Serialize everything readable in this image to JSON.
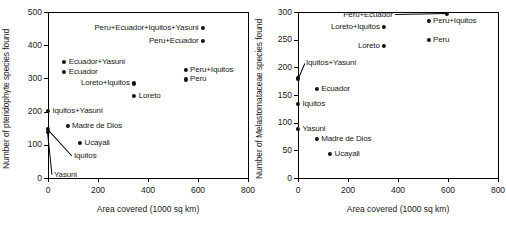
{
  "figure": {
    "panels": [
      {
        "id": "pteridophyte",
        "xlabel": "Area covered (1000 sq km)",
        "ylabel": "Number of pteridophyte species found",
        "xticks": [
          "0",
          "200",
          "400",
          "600",
          "800"
        ],
        "yticks": [
          "0",
          "100",
          "200",
          "300",
          "400",
          "500"
        ]
      },
      {
        "id": "melastomataceae",
        "xlabel": "Area covered (1000 sq km)",
        "ylabel": "Number of Melastomataceae species found",
        "xticks": [
          "0",
          "200",
          "400",
          "600",
          "800"
        ],
        "yticks": [
          "0",
          "50",
          "100",
          "150",
          "200",
          "250",
          "300"
        ]
      }
    ]
  },
  "chart_data": [
    {
      "type": "scatter",
      "title": "",
      "xlabel": "Area covered (1000 sq km)",
      "ylabel": "Number of pteridophyte species found",
      "xlim": [
        0,
        800
      ],
      "ylim": [
        0,
        500
      ],
      "xticks": [
        0,
        200,
        400,
        600,
        800
      ],
      "yticks": [
        0,
        100,
        200,
        300,
        400,
        500
      ],
      "grid": false,
      "legend": "none",
      "points": [
        {
          "label": "Peru+Ecuador+Iquitos+Yasuni",
          "x": 620,
          "y": 452,
          "label_side": "left"
        },
        {
          "label": "Peru+Ecuador",
          "x": 620,
          "y": 413,
          "label_side": "left"
        },
        {
          "label": "Ecuador+Yasuni",
          "x": 65,
          "y": 350,
          "label_side": "right"
        },
        {
          "label": "Ecuador",
          "x": 65,
          "y": 320,
          "label_side": "right"
        },
        {
          "label": "Peru+Iquitos",
          "x": 550,
          "y": 326,
          "label_side": "right"
        },
        {
          "label": "Peru",
          "x": 550,
          "y": 297,
          "label_side": "right"
        },
        {
          "label": "Loreto+Iquitos",
          "x": 345,
          "y": 285,
          "label_side": "left"
        },
        {
          "label": "Loreto",
          "x": 345,
          "y": 247,
          "label_side": "right"
        },
        {
          "label": "Iquitos+Yasuni",
          "x": 0,
          "y": 201,
          "label_side": "right"
        },
        {
          "label": "Madre de Dios",
          "x": 78,
          "y": 157,
          "label_side": "right"
        },
        {
          "label": "Iquitos",
          "x": 0,
          "y": 148,
          "label_side": "leader"
        },
        {
          "label": "Yasuni",
          "x": 0,
          "y": 140,
          "label_side": "leader"
        },
        {
          "label": "Ucayali",
          "x": 128,
          "y": 105,
          "label_side": "right"
        }
      ]
    },
    {
      "type": "scatter",
      "title": "",
      "xlabel": "Area covered (1000 sq km)",
      "ylabel": "Number of Melastomataceae species found",
      "xlim": [
        0,
        800
      ],
      "ylim": [
        0,
        300
      ],
      "xticks": [
        0,
        200,
        400,
        600,
        800
      ],
      "yticks": [
        0,
        50,
        100,
        150,
        200,
        250,
        300
      ],
      "grid": false,
      "legend": "none",
      "points": [
        {
          "label": "Peru+Ecuador",
          "x": 595,
          "y": 296,
          "label_side": "leader"
        },
        {
          "label": "Peru+Iquitos",
          "x": 522,
          "y": 284,
          "label_side": "right"
        },
        {
          "label": "Loreto+Iquitos",
          "x": 345,
          "y": 273,
          "label_side": "left"
        },
        {
          "label": "Peru",
          "x": 522,
          "y": 249,
          "label_side": "right"
        },
        {
          "label": "Loreto",
          "x": 345,
          "y": 238,
          "label_side": "left"
        },
        {
          "label": "Iquitos+Yasuni",
          "x": 0,
          "y": 180,
          "label_side": "leader"
        },
        {
          "label": "Ecuador",
          "x": 75,
          "y": 161,
          "label_side": "right"
        },
        {
          "label": "Iquitos",
          "x": 0,
          "y": 134,
          "label_side": "right"
        },
        {
          "label": "Yasuni",
          "x": 0,
          "y": 88,
          "label_side": "right"
        },
        {
          "label": "Madre de Dios",
          "x": 75,
          "y": 70,
          "label_side": "right"
        },
        {
          "label": "Ucayali",
          "x": 128,
          "y": 44,
          "label_side": "right"
        }
      ]
    }
  ]
}
